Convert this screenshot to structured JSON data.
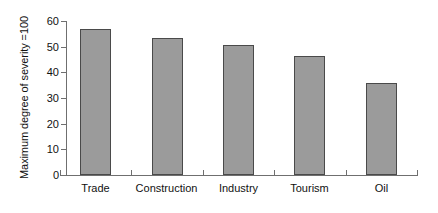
{
  "chart_data": {
    "type": "bar",
    "title": "",
    "subtitle": "",
    "xlabel": "",
    "ylabel": "Maximum degree of severity =100",
    "categories": [
      "Trade",
      "Construction",
      "Industry",
      "Tourism",
      "Oil"
    ],
    "values": [
      57,
      53.5,
      50.5,
      46.5,
      36
    ],
    "series": [
      {
        "name": "Maximum degree of severity",
        "values": [
          57,
          53.5,
          50.5,
          46.5,
          36
        ]
      }
    ],
    "ylim": [
      0,
      60
    ],
    "yticks": [
      0,
      10,
      20,
      30,
      40,
      50,
      60
    ],
    "ytick_labels": [
      "0",
      "10",
      "20",
      "30",
      "40",
      "50",
      "60"
    ],
    "xtick_labels": [
      "Trade",
      "Construction",
      "Industry",
      "Tourism",
      "Oil"
    ],
    "grid": false,
    "legend": null,
    "legend_position": "none",
    "annotations": [],
    "bar_fill_color": "#9b9b9b",
    "bar_border_color": "#4a4a4a",
    "axis_color": "#6f6f6f",
    "background_color": "#ffffff",
    "text_color": "#111111"
  }
}
